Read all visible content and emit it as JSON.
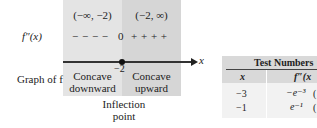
{
  "diagram": {
    "row_labels": {
      "second_derivative": "f″(x)",
      "graph": "Graph of f"
    },
    "intervals": [
      "(−∞, −2)",
      "(−2, ∞)"
    ],
    "signs": {
      "left": "− − − −",
      "zero": "0",
      "right": "+ + + +"
    },
    "axis": {
      "variable": "x",
      "critical_value": "−2"
    },
    "concavity": {
      "left": [
        "Concave",
        "downward"
      ],
      "right": [
        "Concave",
        "upward"
      ]
    },
    "annotation": [
      "Inflection",
      "point"
    ],
    "colors": {
      "left_panel": "#e4e4e4",
      "right_panel": "#d6d6d6"
    }
  },
  "table": {
    "title": "Test Numbers",
    "headers": [
      "x",
      "f″(x"
    ],
    "rows": [
      {
        "x": "−3",
        "fpp": "−e⁻³",
        "trail": "("
      },
      {
        "x": "−1",
        "fpp": "e⁻¹",
        "trail": "("
      }
    ]
  }
}
